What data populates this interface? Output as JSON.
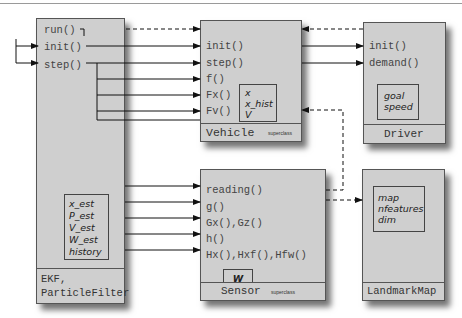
{
  "classes": {
    "ekf": {
      "name_line1": "EKF,",
      "name_line2": "ParticleFilter",
      "methods": [
        "run()",
        "init()",
        "step()"
      ],
      "attributes": [
        "x_est",
        "P_est",
        "V_est",
        "W_est",
        "history"
      ]
    },
    "vehicle": {
      "name": "Vehicle",
      "stereotype": "superclass",
      "methods": [
        "init()",
        "step()",
        "f()",
        "Fx()",
        "Fv()"
      ],
      "attributes": [
        "x",
        "x_hist",
        "V"
      ]
    },
    "driver": {
      "name": "Driver",
      "methods": [
        "init()",
        "demand()"
      ],
      "attributes": [
        "goal",
        "speed"
      ]
    },
    "sensor": {
      "name": "Sensor",
      "stereotype": "superclass",
      "methods": [
        "reading()",
        "g()",
        "Gx(),Gz()",
        "h()",
        "Hx(),Hxf(),Hfw()"
      ],
      "attributes": [
        "W"
      ]
    },
    "landmarkmap": {
      "name": "LandmarkMap",
      "attributes": [
        "map",
        "nfeatures",
        "dim"
      ]
    }
  },
  "colors": {
    "box_fill": "#cfcfcf",
    "border": "#555555",
    "text": "#444444"
  }
}
